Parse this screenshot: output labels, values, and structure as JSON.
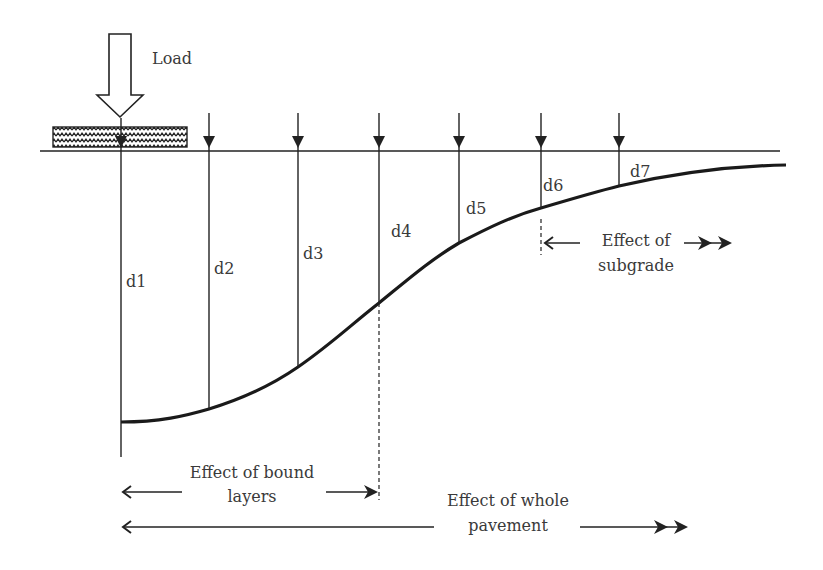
{
  "diagram": {
    "load_label": "Load",
    "deflections": [
      {
        "label": "d1",
        "x": 121,
        "sensor_top": 108,
        "bottom": 422,
        "lx": 126,
        "ly": 287
      },
      {
        "label": "d2",
        "x": 209,
        "sensor_top": 108,
        "bottom": 409,
        "lx": 214,
        "ly": 274
      },
      {
        "label": "d3",
        "x": 298,
        "sensor_top": 108,
        "bottom": 367,
        "lx": 303,
        "ly": 259
      },
      {
        "label": "d4",
        "x": 379,
        "sensor_top": 108,
        "bottom": 303,
        "lx": 391,
        "ly": 237
      },
      {
        "label": "d5",
        "x": 459,
        "sensor_top": 108,
        "bottom": 243,
        "lx": 466,
        "ly": 214
      },
      {
        "label": "d6",
        "x": 541,
        "sensor_top": 108,
        "bottom": 208,
        "lx": 543,
        "ly": 191
      },
      {
        "label": "d7",
        "x": 619,
        "sensor_top": 108,
        "bottom": 186,
        "lx": 630,
        "ly": 177
      }
    ],
    "zones": {
      "subgrade": {
        "line1": "Effect of",
        "line2": "subgrade"
      },
      "bound_layers": {
        "line1": "Effect of bound",
        "line2": "layers"
      },
      "whole_pavement": {
        "line1": "Effect of whole",
        "line2": "pavement"
      }
    },
    "colors": {
      "line": "#222222",
      "text": "#3a3a3a",
      "background": "#ffffff"
    }
  }
}
